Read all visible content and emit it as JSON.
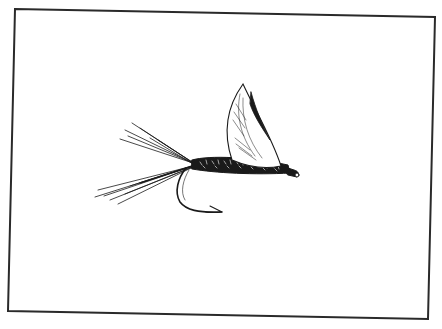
{
  "image": {
    "description": "Pen-and-ink illustration of a dry fly (fishing fly) inside a slightly rotated rectangular frame",
    "subject": "dry fly with upright wing, dubbed body, fibrous tail and exposed hook",
    "colors": {
      "background": "#ffffff",
      "ink": "#1a1a1a",
      "frame": "#2a2a2a"
    },
    "frame": {
      "top_left": [
        15,
        9
      ],
      "top_right": [
        435,
        17
      ],
      "bottom_right": [
        428,
        319
      ],
      "bottom_left": [
        8,
        311
      ]
    },
    "caption": ""
  }
}
